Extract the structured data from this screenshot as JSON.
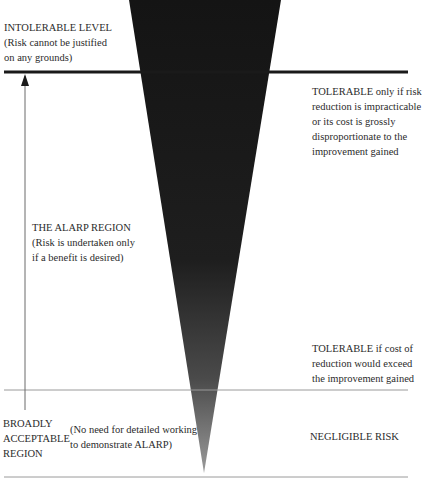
{
  "diagram": {
    "colors": {
      "triangle_top": "#161616",
      "triangle_bottom": "#8a8a8a",
      "thick_line": "#1a1a1a",
      "thin_line": "#9a9a9a",
      "text": "#2b2b2b"
    },
    "regions": {
      "intolerable": {
        "heading": "INTOLERABLE LEVEL",
        "lines": [
          "(Risk cannot be justified",
          "on any grounds)"
        ]
      },
      "alarp": {
        "heading": "THE ALARP REGION",
        "lines": [
          "(Risk is undertaken only",
          "if a benefit is desired)"
        ]
      },
      "broadly_acceptable": {
        "heading_lines": [
          "BROADLY",
          "ACCEPTABLE",
          "REGION"
        ],
        "note_lines": [
          "(No need for detailed working",
          "to demonstrate ALARP)"
        ]
      }
    },
    "right_labels": {
      "tolerable_upper": [
        "TOLERABLE only if risk",
        "reduction is impracticable",
        "or its cost is grossly",
        "disproportionate to the",
        "improvement gained"
      ],
      "tolerable_lower": [
        "TOLERABLE if cost of",
        "reduction would exceed",
        "the improvement gained"
      ],
      "negligible": "NEGLIGIBLE RISK"
    }
  }
}
